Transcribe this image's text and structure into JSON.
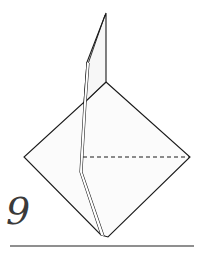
{
  "diagram": {
    "type": "origami-fold-step",
    "step_number": "9",
    "colors": {
      "line": "#1a1a1a",
      "paper_fill": "#fbfbfb",
      "rule": "#6a6a6a",
      "step_number": "#3a3a3a"
    },
    "elements": [
      {
        "name": "diamond-base",
        "description": "square base shown as diamond"
      },
      {
        "name": "raised-flap",
        "description": "narrow flap folded upward with double edge"
      },
      {
        "name": "valley-fold-line",
        "style": "dashed",
        "description": "horizontal dashed fold line across right half"
      },
      {
        "name": "baseline-rule",
        "description": "horizontal rule under step"
      }
    ]
  }
}
